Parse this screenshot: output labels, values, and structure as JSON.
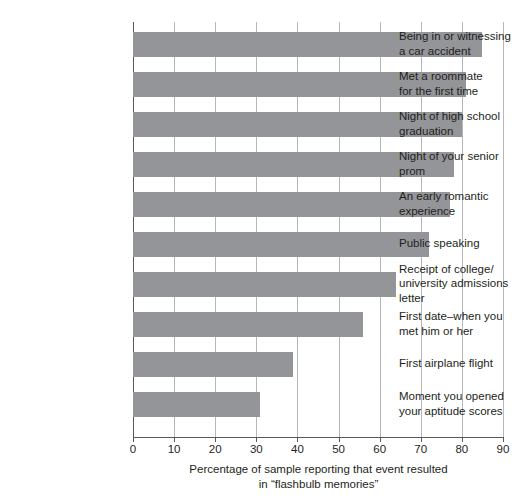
{
  "chart_data": {
    "type": "bar",
    "orientation": "horizontal",
    "title": "",
    "xlabel_line1": "Percentage of sample reporting that event resulted",
    "xlabel_line2": "in “flashbulb memories”",
    "ylabel": "",
    "xlim": [
      0,
      90
    ],
    "xticks": [
      0,
      10,
      20,
      30,
      40,
      50,
      60,
      70,
      80,
      90
    ],
    "xtick_labels": [
      "0",
      "10",
      "20",
      "30",
      "40",
      "50",
      "60",
      "70",
      "80",
      "90"
    ],
    "grid": "vertical",
    "legend": "none",
    "bar_color": "#939598",
    "axis_color": "#58595b",
    "gridline_color": "#b5b7b9",
    "categories": [
      {
        "line1": "Being in or witnessing",
        "line2": "a car accident"
      },
      {
        "line1": "Met a roommate",
        "line2": "for the first time"
      },
      {
        "line1": "Night of high school",
        "line2": "graduation"
      },
      {
        "line1": "Night of your senior",
        "line2": "prom"
      },
      {
        "line1": "An early romantic",
        "line2": "experience"
      },
      {
        "line1": "Public speaking",
        "line2": ""
      },
      {
        "line1": "Receipt of college/",
        "line2": "university admissions",
        "line3": "letter"
      },
      {
        "line1": "First date–when you",
        "line2": "met him or her"
      },
      {
        "line1": "First airplane flight",
        "line2": ""
      },
      {
        "line1": "Moment you opened",
        "line2": "your aptitude scores"
      }
    ],
    "values": [
      85,
      81,
      80,
      78,
      77,
      72,
      64,
      56,
      39,
      31
    ]
  }
}
